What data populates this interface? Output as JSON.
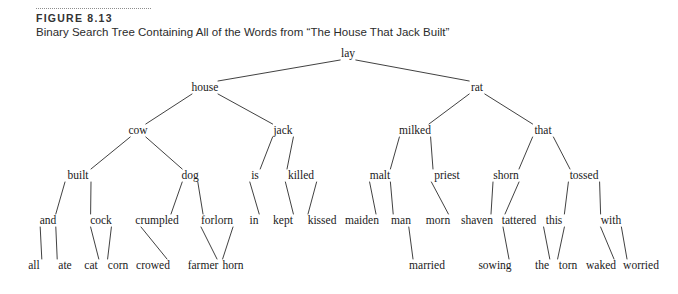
{
  "figure": {
    "label": "FIGURE 8.13",
    "caption": "Binary Search Tree Containing All of the Words from “The House That Jack Built”"
  },
  "colors": {
    "text": "#1a1a1a",
    "caption_text": "#2b2b2b",
    "rule": "#8d8d8d",
    "edge": "#2b2b2b",
    "background": "#ffffff"
  },
  "chart_data": {
    "type": "diagram",
    "diagram_kind": "binary-search-tree",
    "title": "Binary Search Tree Containing All of the Words from “The House That Jack Built”",
    "root": "lay",
    "node_count": 44,
    "depth": 6,
    "nodes": [
      {
        "id": "lay",
        "label": "lay",
        "x": 348,
        "y": 54,
        "level": 0
      },
      {
        "id": "house",
        "label": "house",
        "x": 205,
        "y": 88,
        "level": 1
      },
      {
        "id": "rat",
        "label": "rat",
        "x": 477,
        "y": 88,
        "level": 1
      },
      {
        "id": "cow",
        "label": "cow",
        "x": 138,
        "y": 131,
        "level": 2
      },
      {
        "id": "jack",
        "label": "jack",
        "x": 283,
        "y": 131,
        "level": 2
      },
      {
        "id": "milked",
        "label": "milked",
        "x": 415,
        "y": 131,
        "level": 2
      },
      {
        "id": "that",
        "label": "that",
        "x": 543,
        "y": 131,
        "level": 2
      },
      {
        "id": "built",
        "label": "built",
        "x": 78,
        "y": 176,
        "level": 3
      },
      {
        "id": "dog",
        "label": "dog",
        "x": 190,
        "y": 176,
        "level": 3
      },
      {
        "id": "is",
        "label": "is",
        "x": 255,
        "y": 176,
        "level": 3
      },
      {
        "id": "killed",
        "label": "killed",
        "x": 301,
        "y": 176,
        "level": 3
      },
      {
        "id": "malt",
        "label": "malt",
        "x": 380,
        "y": 176,
        "level": 3
      },
      {
        "id": "priest",
        "label": "priest",
        "x": 447,
        "y": 176,
        "level": 3
      },
      {
        "id": "shorn",
        "label": "shorn",
        "x": 506,
        "y": 176,
        "level": 3
      },
      {
        "id": "tossed",
        "label": "tossed",
        "x": 584,
        "y": 176,
        "level": 3
      },
      {
        "id": "and",
        "label": "and",
        "x": 48,
        "y": 221,
        "level": 4
      },
      {
        "id": "cock",
        "label": "cock",
        "x": 101,
        "y": 221,
        "level": 4
      },
      {
        "id": "crumpled",
        "label": "crumpled",
        "x": 157,
        "y": 221,
        "level": 4
      },
      {
        "id": "forlorn",
        "label": "forlorn",
        "x": 217,
        "y": 221,
        "level": 4
      },
      {
        "id": "in",
        "label": "in",
        "x": 254,
        "y": 221,
        "level": 4
      },
      {
        "id": "kept",
        "label": "kept",
        "x": 283,
        "y": 221,
        "level": 4
      },
      {
        "id": "kissed",
        "label": "kissed",
        "x": 322,
        "y": 221,
        "level": 4
      },
      {
        "id": "maiden",
        "label": "maiden",
        "x": 362,
        "y": 221,
        "level": 4
      },
      {
        "id": "man",
        "label": "man",
        "x": 401,
        "y": 221,
        "level": 4
      },
      {
        "id": "morn",
        "label": "morn",
        "x": 438,
        "y": 221,
        "level": 4
      },
      {
        "id": "shaven",
        "label": "shaven",
        "x": 477,
        "y": 221,
        "level": 4
      },
      {
        "id": "tattered",
        "label": "tattered",
        "x": 519,
        "y": 221,
        "level": 4
      },
      {
        "id": "this",
        "label": "this",
        "x": 554,
        "y": 221,
        "level": 4
      },
      {
        "id": "with",
        "label": "with",
        "x": 611,
        "y": 221,
        "level": 4
      },
      {
        "id": "all",
        "label": "all",
        "x": 34,
        "y": 266,
        "level": 5
      },
      {
        "id": "ate",
        "label": "ate",
        "x": 65,
        "y": 266,
        "level": 5
      },
      {
        "id": "cat",
        "label": "cat",
        "x": 91,
        "y": 266,
        "level": 5
      },
      {
        "id": "corn",
        "label": "corn",
        "x": 118,
        "y": 266,
        "level": 5
      },
      {
        "id": "crowed",
        "label": "crowed",
        "x": 153,
        "y": 266,
        "level": 5
      },
      {
        "id": "farmer",
        "label": "farmer",
        "x": 203,
        "y": 266,
        "level": 5
      },
      {
        "id": "horn",
        "label": "horn",
        "x": 233,
        "y": 266,
        "level": 5
      },
      {
        "id": "married",
        "label": "married",
        "x": 427,
        "y": 266,
        "level": 5
      },
      {
        "id": "sowing",
        "label": "sowing",
        "x": 495,
        "y": 266,
        "level": 5
      },
      {
        "id": "the",
        "label": "the",
        "x": 542,
        "y": 266,
        "level": 5
      },
      {
        "id": "torn",
        "label": "torn",
        "x": 568,
        "y": 266,
        "level": 5
      },
      {
        "id": "waked",
        "label": "waked",
        "x": 601,
        "y": 266,
        "level": 5
      },
      {
        "id": "worried",
        "label": "worried",
        "x": 641,
        "y": 266,
        "level": 5
      }
    ],
    "edges": [
      {
        "from": "lay",
        "to": "house",
        "side": "left"
      },
      {
        "from": "lay",
        "to": "rat",
        "side": "right"
      },
      {
        "from": "house",
        "to": "cow",
        "side": "left"
      },
      {
        "from": "house",
        "to": "jack",
        "side": "right"
      },
      {
        "from": "rat",
        "to": "milked",
        "side": "left"
      },
      {
        "from": "rat",
        "to": "that",
        "side": "right"
      },
      {
        "from": "cow",
        "to": "built",
        "side": "left"
      },
      {
        "from": "cow",
        "to": "dog",
        "side": "right"
      },
      {
        "from": "jack",
        "to": "is",
        "side": "left"
      },
      {
        "from": "jack",
        "to": "killed",
        "side": "right"
      },
      {
        "from": "milked",
        "to": "malt",
        "side": "left"
      },
      {
        "from": "milked",
        "to": "priest",
        "side": "right"
      },
      {
        "from": "that",
        "to": "shorn",
        "side": "left"
      },
      {
        "from": "that",
        "to": "tossed",
        "side": "right"
      },
      {
        "from": "built",
        "to": "and",
        "side": "left"
      },
      {
        "from": "built",
        "to": "cock",
        "side": "right"
      },
      {
        "from": "dog",
        "to": "crumpled",
        "side": "left"
      },
      {
        "from": "dog",
        "to": "forlorn",
        "side": "right"
      },
      {
        "from": "is",
        "to": "in",
        "side": "left"
      },
      {
        "from": "killed",
        "to": "kept",
        "side": "left"
      },
      {
        "from": "killed",
        "to": "kissed",
        "side": "right"
      },
      {
        "from": "malt",
        "to": "maiden",
        "side": "left"
      },
      {
        "from": "malt",
        "to": "man",
        "side": "right"
      },
      {
        "from": "priest",
        "to": "morn",
        "side": "left"
      },
      {
        "from": "shorn",
        "to": "shaven",
        "side": "left"
      },
      {
        "from": "shorn",
        "to": "tattered",
        "side": "right"
      },
      {
        "from": "tossed",
        "to": "this",
        "side": "left"
      },
      {
        "from": "tossed",
        "to": "with",
        "side": "right"
      },
      {
        "from": "and",
        "to": "all",
        "side": "left"
      },
      {
        "from": "and",
        "to": "ate",
        "side": "right"
      },
      {
        "from": "cock",
        "to": "cat",
        "side": "left"
      },
      {
        "from": "cock",
        "to": "corn",
        "side": "right"
      },
      {
        "from": "crumpled",
        "to": "crowed",
        "side": "left"
      },
      {
        "from": "forlorn",
        "to": "farmer",
        "side": "left"
      },
      {
        "from": "forlorn",
        "to": "horn",
        "side": "right"
      },
      {
        "from": "man",
        "to": "married",
        "side": "right"
      },
      {
        "from": "tattered",
        "to": "sowing",
        "side": "left"
      },
      {
        "from": "this",
        "to": "the",
        "side": "left"
      },
      {
        "from": "this",
        "to": "torn",
        "side": "right"
      },
      {
        "from": "with",
        "to": "waked",
        "side": "left"
      },
      {
        "from": "with",
        "to": "worried",
        "side": "right"
      }
    ]
  }
}
